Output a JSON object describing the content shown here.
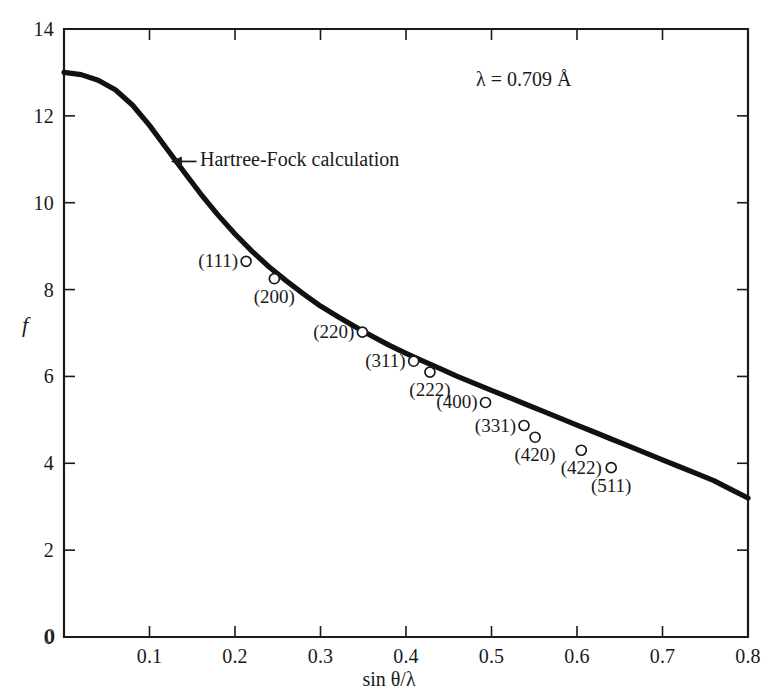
{
  "figure": {
    "title": "",
    "background_color": "#ffffff",
    "ink_color": "#1a1a1a"
  },
  "annotations": {
    "wavelength": "λ = 0.709 Å",
    "curve_label": "Hartree-Fock calculation"
  },
  "axes": {
    "x_title": "sin θ/λ",
    "y_title": "f",
    "x_ticks": [
      "0",
      "0.1",
      "0.2",
      "0.3",
      "0.4",
      "0.5",
      "0.6",
      "0.7",
      "0.8"
    ],
    "y_ticks": [
      "0",
      "2",
      "4",
      "6",
      "8",
      "10",
      "12",
      "14"
    ]
  },
  "chart_data": {
    "type": "scatter",
    "title": "",
    "subtitle": "",
    "xlabel": "sin θ/λ",
    "ylabel": "f",
    "xlim": [
      0,
      0.8
    ],
    "ylim": [
      0,
      14
    ],
    "xticks": [
      0,
      0.1,
      0.2,
      0.3,
      0.4,
      0.5,
      0.6,
      0.7,
      0.8
    ],
    "yticks": [
      0,
      2,
      4,
      6,
      8,
      10,
      12,
      14
    ],
    "grid": false,
    "legend": null,
    "annotations": [
      {
        "text": "λ = 0.709 Å",
        "x": 0.48,
        "y": 13.05
      },
      {
        "text": "Hartree-Fock calculation",
        "x": 0.155,
        "y": 10.95,
        "arrow_to": {
          "x": 0.125,
          "y": 10.95
        }
      }
    ],
    "series": [
      {
        "name": "Hartree-Fock calculation",
        "type": "line",
        "x": [
          0.0,
          0.02,
          0.04,
          0.06,
          0.08,
          0.1,
          0.12,
          0.14,
          0.16,
          0.18,
          0.2,
          0.22,
          0.24,
          0.26,
          0.28,
          0.3,
          0.32,
          0.34,
          0.36,
          0.38,
          0.4,
          0.42,
          0.44,
          0.46,
          0.48,
          0.5,
          0.52,
          0.54,
          0.56,
          0.58,
          0.6,
          0.62,
          0.64,
          0.66,
          0.68,
          0.7,
          0.72,
          0.74,
          0.76,
          0.78,
          0.8
        ],
        "y": [
          13.0,
          12.95,
          12.82,
          12.6,
          12.25,
          11.78,
          11.25,
          10.72,
          10.2,
          9.72,
          9.28,
          8.88,
          8.52,
          8.2,
          7.9,
          7.62,
          7.38,
          7.15,
          6.93,
          6.72,
          6.53,
          6.35,
          6.18,
          6.0,
          5.84,
          5.68,
          5.52,
          5.36,
          5.2,
          5.04,
          4.88,
          4.72,
          4.56,
          4.4,
          4.24,
          4.08,
          3.92,
          3.76,
          3.6,
          3.4,
          3.2
        ]
      },
      {
        "name": "Experimental",
        "type": "scatter",
        "marker": "open-circle",
        "points": [
          {
            "label": "(111)",
            "x": 0.213,
            "y": 8.65,
            "label_side": "right"
          },
          {
            "label": "(200)",
            "x": 0.246,
            "y": 8.25,
            "label_side": "below"
          },
          {
            "label": "(220)",
            "x": 0.349,
            "y": 7.02,
            "label_side": "right"
          },
          {
            "label": "(311)",
            "x": 0.409,
            "y": 6.35,
            "label_side": "right"
          },
          {
            "label": "(222)",
            "x": 0.428,
            "y": 6.1,
            "label_side": "below"
          },
          {
            "label": "(400)",
            "x": 0.493,
            "y": 5.4,
            "label_side": "right"
          },
          {
            "label": "(331)",
            "x": 0.538,
            "y": 4.87,
            "label_side": "right"
          },
          {
            "label": "(420)",
            "x": 0.551,
            "y": 4.6,
            "label_side": "below"
          },
          {
            "label": "(422)",
            "x": 0.605,
            "y": 4.3,
            "label_side": "below"
          },
          {
            "label": "(511)",
            "x": 0.64,
            "y": 3.9,
            "label_side": "below"
          }
        ]
      }
    ]
  }
}
